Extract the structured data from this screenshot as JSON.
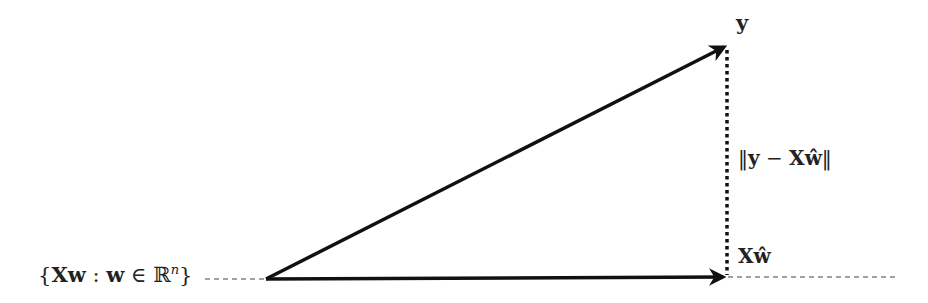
{
  "diagram": {
    "type": "vector-projection",
    "labels": {
      "subspace": "{Xw : w ∈ ℝⁿ}",
      "subspace_parts": {
        "open": "{",
        "Xw": "Xw",
        "colon": " : ",
        "w": "w",
        "in": " ∈ ",
        "R": "ℝ",
        "n": "n",
        "close": "}"
      },
      "y": "y",
      "residual": "‖y − Xŵ‖",
      "residual_parts": {
        "bars_l": "‖",
        "y": "y",
        "minus": " − ",
        "X": "X",
        "w": "ŵ",
        "bars_r": "‖"
      },
      "projection": "Xŵ",
      "projection_parts": {
        "X": "X",
        "w": "ŵ"
      }
    },
    "points": {
      "origin": [
        266,
        279
      ],
      "y": [
        726,
        46
      ],
      "projection": [
        726,
        277
      ]
    },
    "colors": {
      "stroke": "#111111",
      "text": "#222222",
      "dashed": "#444444"
    }
  }
}
